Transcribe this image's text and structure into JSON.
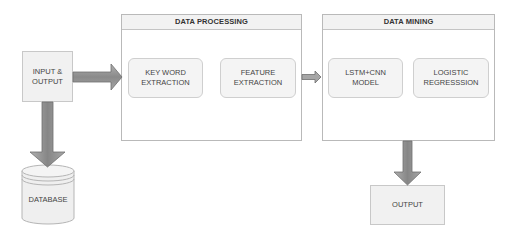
{
  "diagram": {
    "input_output": {
      "label": "INPUT &\nOUTPUT"
    },
    "database": {
      "label": "DATABASE"
    },
    "output": {
      "label": "OUTPUT"
    },
    "data_processing": {
      "title": "DATA PROCESSING",
      "steps": [
        {
          "label": "KEY WORD\nEXTRACTION"
        },
        {
          "label": "FEATURE\nEXTRACTION"
        }
      ]
    },
    "data_mining": {
      "title": "DATA MINING",
      "steps": [
        {
          "label": "LSTM+CNN\nMODEL"
        },
        {
          "label": "LOGISTIC\nREGRESSSION"
        }
      ]
    },
    "edges": [
      {
        "from": "INPUT & OUTPUT",
        "to": "DATA PROCESSING",
        "type": "thick-arrow"
      },
      {
        "from": "INPUT & OUTPUT",
        "to": "DATABASE",
        "type": "thick-arrow"
      },
      {
        "from": "DATA PROCESSING",
        "to": "DATA MINING",
        "type": "small-arrow"
      },
      {
        "from": "DATA MINING",
        "to": "OUTPUT",
        "type": "thick-arrow"
      }
    ],
    "colors": {
      "arrow_fill": "#8f8f8f",
      "arrow_stroke": "#6e6e6e",
      "box_fill": "#f1f1f1",
      "border": "#c4c4c4"
    }
  }
}
